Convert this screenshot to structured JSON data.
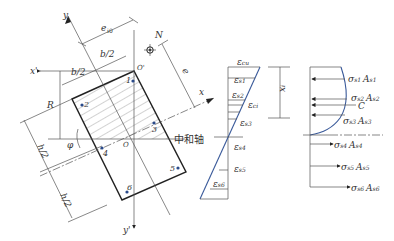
{
  "section": {
    "axes": {
      "x": "x",
      "y": "y",
      "x_prime": "x'",
      "y_prime": "y'"
    },
    "origin": "O",
    "origin_prime": "O'",
    "load": "N",
    "eccentricity": "e",
    "eccentricity_sub": "i0",
    "dim_half_b": "b/2",
    "dim_half_h": "h/2",
    "radius": "R",
    "e3": "e",
    "e3_sub": "3",
    "angle": "φ",
    "neutral_axis": "中和轴",
    "bars": [
      "1",
      "2",
      "3",
      "4",
      "5",
      "6"
    ]
  },
  "strain": {
    "labels": [
      {
        "main": "ε",
        "sub": "cu"
      },
      {
        "main": "ε",
        "sub": "s1"
      },
      {
        "main": "ε",
        "sub": "s2"
      },
      {
        "main": "ε",
        "sub": "ci"
      },
      {
        "main": "ε",
        "sub": "s3"
      },
      {
        "main": "ε",
        "sub": "s4"
      },
      {
        "main": "ε",
        "sub": "s5"
      },
      {
        "main": "ε",
        "sub": "s6"
      }
    ],
    "depth_label": "x",
    "depth_label_sub": "i"
  },
  "stress": {
    "forces": [
      {
        "sigma": "σ",
        "sub": "s1",
        "area": "A",
        "asub": "s1"
      },
      {
        "sigma": "σ",
        "sub": "s2",
        "area": "A",
        "asub": "s2"
      },
      {
        "sigma": "σ",
        "sub": "s3",
        "area": "A",
        "asub": "s3"
      },
      {
        "sigma": "σ",
        "sub": "s4",
        "area": "A",
        "asub": "s4"
      },
      {
        "sigma": "σ",
        "sub": "s5",
        "area": "A",
        "asub": "s5"
      },
      {
        "sigma": "σ",
        "sub": "s6",
        "area": "A",
        "asub": "s6"
      }
    ],
    "compression_resultant": "C"
  },
  "colors": {
    "line": "#222222",
    "curve": "#3a5a9a",
    "bar_dot": "#2a4a8a"
  }
}
